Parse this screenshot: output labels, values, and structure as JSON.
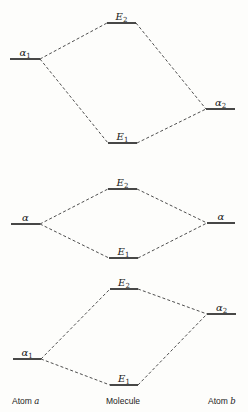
{
  "colors": {
    "line": "#1a1a1a",
    "dashed": "#3a3a3a",
    "background": "#fdfdfb"
  },
  "column_labels": {
    "left": {
      "text": "Atom ",
      "italic": "a"
    },
    "center": {
      "text": "Molecule"
    },
    "right": {
      "text": "Atom ",
      "italic": "b"
    }
  },
  "diagrams": [
    {
      "name": "heteronuclear-alpha1-above-alpha2",
      "levels": [
        {
          "id": "left",
          "symbol": "α",
          "sub": "1",
          "x1": 10,
          "x2": 40,
          "y": 59
        },
        {
          "id": "E2",
          "symbol": "E",
          "sub": "2",
          "x1": 107,
          "x2": 136,
          "y": 23
        },
        {
          "id": "E1",
          "symbol": "E",
          "sub": "1",
          "x1": 108,
          "x2": 137,
          "y": 143
        },
        {
          "id": "right",
          "symbol": "α",
          "sub": "2",
          "x1": 206,
          "x2": 235,
          "y": 109
        }
      ]
    },
    {
      "name": "homonuclear-equal-alpha",
      "levels": [
        {
          "id": "left",
          "symbol": "α",
          "sub": "",
          "x1": 11,
          "x2": 40,
          "y": 224
        },
        {
          "id": "E2",
          "symbol": "E",
          "sub": "2",
          "x1": 108,
          "x2": 137,
          "y": 189
        },
        {
          "id": "E1",
          "symbol": "E",
          "sub": "1",
          "x1": 109,
          "x2": 138,
          "y": 258
        },
        {
          "id": "right",
          "symbol": "α",
          "sub": "",
          "x1": 207,
          "x2": 235,
          "y": 223
        }
      ]
    },
    {
      "name": "heteronuclear-alpha1-below-alpha2",
      "levels": [
        {
          "id": "left",
          "symbol": "α",
          "sub": "1",
          "x1": 13,
          "x2": 41,
          "y": 359
        },
        {
          "id": "E2",
          "symbol": "E",
          "sub": "2",
          "x1": 110,
          "x2": 138,
          "y": 289
        },
        {
          "id": "E1",
          "symbol": "E",
          "sub": "1",
          "x1": 110,
          "x2": 138,
          "y": 385
        },
        {
          "id": "right",
          "symbol": "α",
          "sub": "2",
          "x1": 207,
          "x2": 236,
          "y": 314
        }
      ]
    }
  ]
}
